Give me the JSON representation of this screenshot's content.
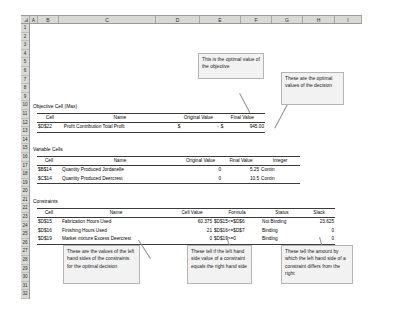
{
  "spreadsheet": {
    "columns": [
      "A",
      "B",
      "C",
      "D",
      "E",
      "F",
      "G",
      "H",
      "I"
    ],
    "rows": [
      "1",
      "2",
      "3",
      "4",
      "5",
      "6",
      "7",
      "8",
      "9",
      "10",
      "11",
      "12",
      "13",
      "14",
      "15",
      "16",
      "17",
      "18",
      "19",
      "20",
      "21",
      "22",
      "23",
      "24",
      "25",
      "26",
      "27",
      "28",
      "29",
      "30",
      "31",
      "32"
    ]
  },
  "objective": {
    "section_title": "Objective Cell (Max)",
    "headers": [
      "Cell",
      "Name",
      "Original Value",
      "Final Value"
    ],
    "rows": [
      {
        "cell": "$D$22",
        "name": "Profit Contribution Total Profit",
        "original_currency": "$",
        "original_value": "-",
        "final_currency": "$",
        "final_value": "945.00"
      }
    ]
  },
  "variables": {
    "section_title": "Variable Cells",
    "headers": [
      "Cell",
      "Name",
      "Original Value",
      "Final Value",
      "Integer"
    ],
    "rows": [
      {
        "cell": "$B$14",
        "name": "Quantity Produced Jordanelle",
        "original_value": "0",
        "final_value": "5.25",
        "integer": "Contin"
      },
      {
        "cell": "$C$14",
        "name": "Quantity Produced Deercrest",
        "original_value": "0",
        "final_value": "10.5",
        "integer": "Contin"
      }
    ]
  },
  "constraints": {
    "section_title": "Constraints",
    "headers": [
      "Cell",
      "Name",
      "Cell Value",
      "Formula",
      "Status",
      "Slack"
    ],
    "rows": [
      {
        "cell": "$D$15",
        "name": "Fabrication Hours Used",
        "cell_value": "60.375",
        "formula": "$D$15<=$D$6",
        "status": "Not Binding",
        "slack": "23.625"
      },
      {
        "cell": "$D$16",
        "name": "Finishing Hours Used",
        "cell_value": "21",
        "formula": "$D$16<=$D$7",
        "status": "Binding",
        "slack": "0"
      },
      {
        "cell": "$D$19",
        "name": "Market mixture  Excess Deercrest",
        "cell_value": "0",
        "formula": "$D$19>=0",
        "status": "Binding",
        "slack": "0"
      }
    ]
  },
  "callouts": {
    "objective_value": "This is the optimal value of the objective",
    "optimal_decision": "These are the optimal values of the decision",
    "lhs_values": "These are the values of the left hand sides of the constraints for the optimal decision",
    "binding_status": "These tell if the left hand side value of a constraint equals the right hand side",
    "slack_amount": "These tell the amount by which the left hand side of a constraint differs from the right"
  }
}
